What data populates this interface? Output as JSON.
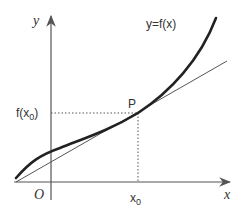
{
  "diagram": {
    "labels": {
      "y_axis": "y",
      "x_axis": "x",
      "origin": "O",
      "curve": "y=f(x)",
      "point": "P",
      "fx0_main": "f(x",
      "fx0_sub": "0",
      "fx0_close": ")",
      "x0_main": "x",
      "x0_sub": "0"
    },
    "colors": {
      "curve": "#222222",
      "tangent": "#555555",
      "axes": "#555555",
      "guides": "#555555"
    }
  }
}
